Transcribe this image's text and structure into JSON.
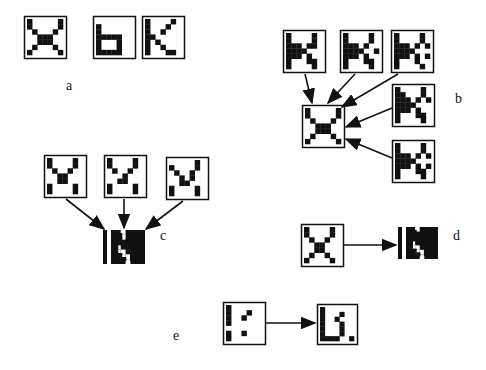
{
  "figure": {
    "panels": {
      "a": {
        "label": "a",
        "label_pos": [
          66,
          90
        ],
        "items": [
          {
            "name": "x-pattern",
            "x": 24,
            "y": 16,
            "size": 42,
            "grid": [
              "X.....X",
              "X.....X",
              ".X...X.",
              "..XXX..",
              "..XXX..",
              ".X...X.",
              "X.....X"
            ]
          },
          {
            "name": "b-pattern",
            "x": 93,
            "y": 16,
            "size": 42,
            "grid": [
              ".......",
              "X......",
              "X......",
              "XXXXX..",
              "X...X..",
              "X...X..",
              "XXXXX.."
            ]
          },
          {
            "name": "k-pattern",
            "x": 142,
            "y": 16,
            "size": 42,
            "grid": [
              "X....X.",
              "X...X..",
              "X..X...",
              "XX.....",
              "X.X....",
              "X..X...",
              "X...XX."
            ]
          }
        ]
      },
      "b": {
        "label": "b",
        "label_pos": [
          455,
          103
        ],
        "target": {
          "name": "x-pattern",
          "x": 302,
          "y": 105,
          "size": 42,
          "grid": [
            "X.....X",
            "X.....X",
            ".X...X.",
            "..XXX..",
            "..XXX..",
            ".X...X.",
            "X.....X"
          ]
        },
        "sources": [
          {
            "name": "noisy-x-1",
            "x": 283,
            "y": 30,
            "size": 42,
            "grid": [
              "X....X.",
              "X....X.",
              "XXX.XX.",
              "XXXX...",
              "XXX.X..",
              "X...XX.",
              "X....X."
            ]
          },
          {
            "name": "noisy-x-2",
            "x": 340,
            "y": 30,
            "size": 42,
            "grid": [
              "X....X.",
              "X....X.",
              "XXX.X..",
              "XXXX..X",
              "XXX.X..",
              "X...XX.",
              "X....X."
            ]
          },
          {
            "name": "noisy-x-3",
            "x": 391,
            "y": 30,
            "size": 42,
            "grid": [
              "X....X.",
              "X....X.",
              "XXX.X.X",
              "XXXX...",
              "XXX.X.X",
              "X...X..",
              "X....X."
            ]
          },
          {
            "name": "noisy-x-4",
            "x": 392,
            "y": 84,
            "size": 42,
            "grid": [
              "X....X.",
              "XX...X.",
              "XXX.X.X",
              "XXXX...",
              "XXX.X..",
              "X...XX.",
              "X....X."
            ]
          },
          {
            "name": "noisy-x-5",
            "x": 392,
            "y": 140,
            "size": 42,
            "grid": [
              "X....X.",
              "X....X.",
              "XXX.X.X",
              "XXXX...",
              "XXX.X.X",
              "X...XX.",
              "X....X."
            ]
          }
        ]
      },
      "c": {
        "label": "c",
        "label_pos": [
          160,
          240
        ],
        "target": {
          "name": "inverted-pattern",
          "x": 111,
          "y": 230,
          "size": 34,
          "grid": [
            "XX.XXXX",
            "XX.XXXX",
            "XXXXXXX",
            "X.XXXXX",
            "X..XXXX",
            "XX..XXX",
            "XXX.XXX"
          ],
          "bar_x": 103
        },
        "sources": [
          {
            "name": "v-pattern-1",
            "x": 44,
            "y": 155,
            "size": 42,
            "grid": [
              "X....X.",
              "X....X.",
              ".X..X..",
              "..XX...",
              "..XX...",
              "X....X.",
              "X....X."
            ]
          },
          {
            "name": "v-pattern-2",
            "x": 104,
            "y": 155,
            "size": 42,
            "grid": [
              "X....X.",
              "X....X.",
              ".X..X..",
              "...X...",
              "..XX...",
              "X....X.",
              "X....X."
            ]
          },
          {
            "name": "v-pattern-3",
            "x": 166,
            "y": 157,
            "size": 42,
            "grid": [
              ".....X.",
              "X....X.",
              ".X..X..",
              "..X.X..",
              "..XX...",
              "X....X.",
              "X....X."
            ]
          }
        ]
      },
      "d": {
        "label": "d",
        "label_pos": [
          453,
          240
        ],
        "source": {
          "name": "x-pattern",
          "x": 301,
          "y": 224,
          "size": 42,
          "grid": [
            "X....X.",
            "X....X.",
            ".X..X..",
            "..XX...",
            "..XX...",
            ".X..X..",
            "X....X."
          ]
        },
        "target": {
          "name": "inverted-pattern",
          "x": 406,
          "y": 227,
          "size": 32,
          "grid": [
            "XX.XXXX",
            "XXXXXXX",
            "XXXXXXX",
            "X.XXXXX",
            "X..XXXX",
            "XX..XXX",
            "XXX.XXX"
          ],
          "bar_x": 398
        }
      },
      "e": {
        "label": "e",
        "label_pos": [
          173,
          340
        ],
        "source": {
          "name": "partial-pattern",
          "x": 223,
          "y": 302,
          "size": 42,
          "grid": [
            "X......",
            "X...X..",
            "X..X...",
            "X......",
            "......",
            "X..X...",
            "X......"
          ]
        },
        "target": {
          "name": "b-recalled-pattern",
          "x": 317,
          "y": 304,
          "size": 40,
          "grid": [
            "X......",
            "X...X..",
            "X..X...",
            "X...X..",
            "X...X..",
            "X...X..",
            "XXXX..X"
          ]
        }
      }
    }
  }
}
